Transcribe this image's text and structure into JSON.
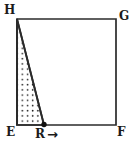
{
  "figure": {
    "kind": "geometry-diagram",
    "canvas": {
      "width": 133,
      "height": 146,
      "background": "#ffffff"
    },
    "stroke_color": "#2b2b2b",
    "fill_pattern": "dot-grid-stipple",
    "fill_dot_color": "#1f1f1f",
    "vertices": [
      {
        "name": "H",
        "label": "H",
        "x": 17,
        "y": 19
      },
      {
        "name": "G",
        "label": "G",
        "x": 116,
        "y": 19
      },
      {
        "name": "F",
        "label": "F",
        "x": 116,
        "y": 125
      },
      {
        "name": "E",
        "label": "E",
        "x": 17,
        "y": 125
      }
    ],
    "quadrilateral_path": "17,19 116,19 116,125 17,125",
    "marked_point": {
      "name": "R",
      "label": "R",
      "x": 44,
      "y": 125,
      "dot_radius": 2.6,
      "dot_color": "#111111",
      "arrow_glyph": "→",
      "arrow_name": "rightward-arrow"
    },
    "shaded_region": {
      "name": "triangle-HRE",
      "path": "17,19 44,125 17,125",
      "vertices": [
        "H",
        "R",
        "E"
      ]
    },
    "segments": [
      {
        "name": "HG",
        "from": "H",
        "to": "G"
      },
      {
        "name": "GF",
        "from": "G",
        "to": "F"
      },
      {
        "name": "FE",
        "from": "F",
        "to": "E"
      },
      {
        "name": "EH",
        "from": "E",
        "to": "H"
      },
      {
        "name": "HR",
        "from": "H",
        "to": "R"
      }
    ]
  }
}
